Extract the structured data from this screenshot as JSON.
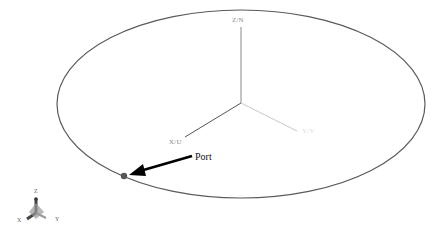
{
  "diagram": {
    "type": "3d-coordinate-view",
    "colors": {
      "background": "#ffffff",
      "ellipse": "#5a5a5a",
      "z_axis": "#8a8a8a",
      "x_axis": "#555555",
      "y_axis": "#c8c8c8",
      "arrow": "#000000",
      "port_marker": "#555555"
    },
    "axes": {
      "z": {
        "label": "Z/N"
      },
      "x": {
        "label": "X/U"
      },
      "y": {
        "label": "Y/V"
      }
    },
    "annotation": {
      "label": "Port"
    },
    "triad": {
      "z_label": "Z",
      "x_label": "X",
      "y_label": "Y"
    }
  }
}
